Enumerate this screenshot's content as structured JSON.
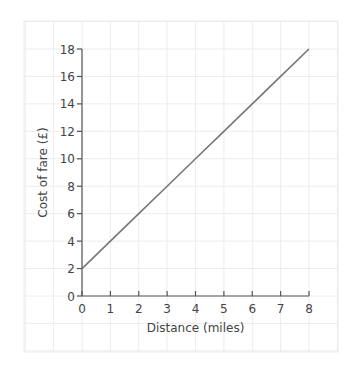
{
  "chart_data": {
    "type": "line",
    "title": "",
    "xlabel": "Distance (miles)",
    "ylabel": "Cost of fare (£)",
    "xlim": [
      0,
      8
    ],
    "ylim": [
      0,
      18
    ],
    "x_ticks": [
      0,
      1,
      2,
      3,
      4,
      5,
      6,
      7,
      8
    ],
    "y_ticks": [
      0,
      2,
      4,
      6,
      8,
      10,
      12,
      14,
      16,
      18
    ],
    "grid": true,
    "legend": null,
    "series": [
      {
        "name": "Cost of fare",
        "x": [
          0,
          1,
          2,
          3,
          4,
          5,
          6,
          7,
          8
        ],
        "y": [
          2,
          4,
          6,
          8,
          10,
          12,
          14,
          16,
          18
        ]
      }
    ]
  },
  "colors": {
    "axis": "#555555",
    "line": "#777777",
    "grid": "#ececec",
    "text": "#444444"
  }
}
